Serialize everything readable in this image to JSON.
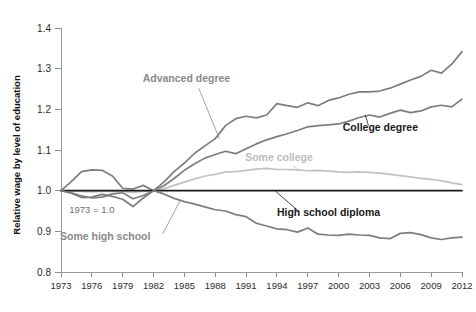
{
  "chart_data": {
    "type": "line",
    "title": "",
    "xlabel": "",
    "ylabel": "Relative wage by level of education",
    "xlim": [
      1973,
      2012
    ],
    "ylim": [
      0.8,
      1.4
    ],
    "grid": false,
    "legend": "inline-labels",
    "annotations": [
      {
        "text": "1973 = 1.0",
        "x": 1976,
        "y": 0.945
      }
    ],
    "y_ticks": [
      "1.4",
      "1.3",
      "1.2",
      "1.1",
      "1.0",
      "0.9",
      "0.8"
    ],
    "y_tick_values": [
      1.4,
      1.3,
      1.2,
      1.1,
      1.0,
      0.9,
      0.8
    ],
    "x_ticks": [
      "1973",
      "1976",
      "1979",
      "1982",
      "1985",
      "1988",
      "1991",
      "1994",
      "1997",
      "2000",
      "2003",
      "2006",
      "2009",
      "2012"
    ],
    "x_tick_values": [
      1973,
      1976,
      1979,
      1982,
      1985,
      1988,
      1991,
      1994,
      1997,
      2000,
      2003,
      2006,
      2009,
      2012
    ],
    "x": [
      1973,
      1974,
      1975,
      1976,
      1977,
      1978,
      1979,
      1980,
      1981,
      1982,
      1983,
      1984,
      1985,
      1986,
      1987,
      1988,
      1989,
      1990,
      1991,
      1992,
      1993,
      1994,
      1995,
      1996,
      1997,
      1998,
      1999,
      2000,
      2001,
      2002,
      2003,
      2004,
      2005,
      2006,
      2007,
      2008,
      2009,
      2010,
      2011,
      2012
    ],
    "series": [
      {
        "name": "Advanced degree",
        "color": "#7d7d7d",
        "label_color": "#8a8a8a",
        "label_x": 1985.2,
        "label_y": 1.268,
        "values": [
          1.0,
          1.022,
          1.047,
          1.051,
          1.05,
          1.036,
          1.006,
          1.004,
          1.013,
          1.0,
          1.021,
          1.047,
          1.068,
          1.092,
          1.11,
          1.128,
          1.16,
          1.177,
          1.183,
          1.179,
          1.186,
          1.214,
          1.209,
          1.205,
          1.216,
          1.209,
          1.222,
          1.228,
          1.237,
          1.243,
          1.243,
          1.245,
          1.252,
          1.262,
          1.272,
          1.281,
          1.296,
          1.289,
          1.311,
          1.342
        ]
      },
      {
        "name": "College degree",
        "color": "#7d7d7d",
        "label_color": "#1a1a1a",
        "label_x": 2000.4,
        "label_y": 1.147,
        "values": [
          1.0,
          0.995,
          0.987,
          0.982,
          0.984,
          0.992,
          0.995,
          0.98,
          0.988,
          1.0,
          1.012,
          1.03,
          1.05,
          1.066,
          1.08,
          1.089,
          1.097,
          1.091,
          1.103,
          1.115,
          1.125,
          1.133,
          1.14,
          1.148,
          1.157,
          1.16,
          1.162,
          1.164,
          1.171,
          1.18,
          1.186,
          1.181,
          1.19,
          1.198,
          1.192,
          1.196,
          1.206,
          1.21,
          1.206,
          1.225
        ]
      },
      {
        "name": "Some college",
        "color": "#c2c2c2",
        "label_color": "#bdbdbd",
        "label_x": 1994.2,
        "label_y": 1.072,
        "values": [
          1.0,
          0.999,
          0.998,
          0.997,
          0.998,
          0.999,
          0.998,
          0.996,
          0.998,
          1.0,
          1.005,
          1.013,
          1.021,
          1.029,
          1.036,
          1.04,
          1.046,
          1.047,
          1.05,
          1.053,
          1.055,
          1.052,
          1.052,
          1.051,
          1.049,
          1.05,
          1.048,
          1.046,
          1.045,
          1.046,
          1.045,
          1.043,
          1.04,
          1.037,
          1.034,
          1.03,
          1.028,
          1.024,
          1.019,
          1.015
        ]
      },
      {
        "name": "High school diploma",
        "color": "#1a1a1a",
        "label_color": "#1a1a1a",
        "label_x": 1994.0,
        "label_y": 0.937,
        "values": [
          1.0,
          1.0,
          1.0,
          1.0,
          1.0,
          1.0,
          1.0,
          1.0,
          1.0,
          1.0,
          1.0,
          1.0,
          1.0,
          1.0,
          1.0,
          1.0,
          1.0,
          1.0,
          1.0,
          1.0,
          1.0,
          1.0,
          1.0,
          1.0,
          1.0,
          1.0,
          1.0,
          1.0,
          1.0,
          1.0,
          1.0,
          1.0,
          1.0,
          1.0,
          1.0,
          1.0,
          1.0,
          1.0,
          1.0,
          1.0
        ]
      },
      {
        "name": "Some high school",
        "color": "#7d7d7d",
        "label_color": "#8a8a8a",
        "label_x": 1977.3,
        "label_y": 0.878,
        "values": [
          1.0,
          0.994,
          0.983,
          0.984,
          0.991,
          0.986,
          0.979,
          0.961,
          0.982,
          1.0,
          0.992,
          0.981,
          0.973,
          0.967,
          0.96,
          0.953,
          0.95,
          0.941,
          0.936,
          0.92,
          0.913,
          0.906,
          0.904,
          0.898,
          0.908,
          0.893,
          0.891,
          0.89,
          0.893,
          0.891,
          0.89,
          0.884,
          0.882,
          0.895,
          0.897,
          0.892,
          0.884,
          0.88,
          0.884,
          0.886
        ]
      }
    ]
  }
}
